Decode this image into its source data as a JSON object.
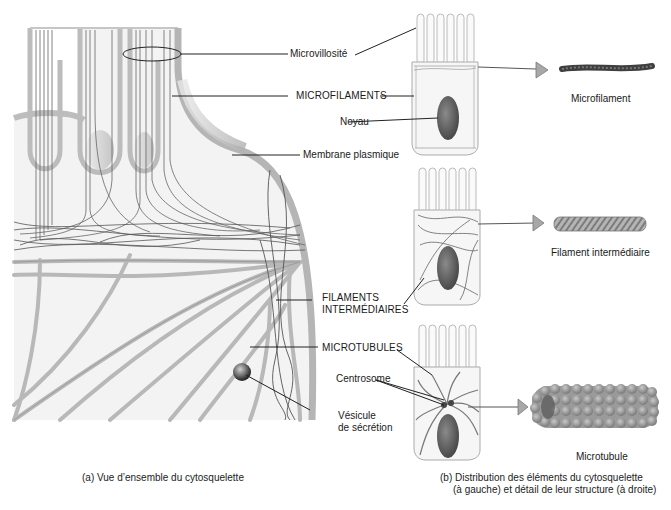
{
  "figure": {
    "panel_a": {
      "caption": "(a) Vue d’ensemble du cytosquelette",
      "labels": {
        "microvillosite": "Microvillosité",
        "microfilaments": "MICROFILAMENTS",
        "noyau": "Noyau",
        "membrane": "Membrane plasmique",
        "filaments_line1": "FILAMENTS",
        "filaments_line2": "INTERMÉDIAIRES",
        "microtubules": "MICROTUBULES",
        "centrosome": "Centrosome",
        "vesicule_line1": "Vésicule",
        "vesicule_line2": "de sécrétion"
      }
    },
    "panel_b": {
      "caption_line1": "(b) Distribution des éléments du cytosquelette",
      "caption_line2": "(à gauche) et détail de leur structure (à droite)",
      "structures": [
        {
          "name": "Microfilament"
        },
        {
          "name": "Filament intermédiaire"
        },
        {
          "name": "Microtubule"
        }
      ]
    },
    "colors": {
      "membrane": "#b9b9b9",
      "filament": "#555555",
      "nucleus": "#6a6a6a",
      "arrow": "#a8a8a8",
      "background": "#ffffff"
    }
  }
}
